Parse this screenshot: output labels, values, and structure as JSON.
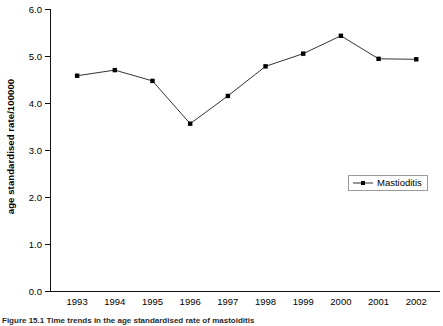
{
  "chart_data": {
    "type": "line",
    "title": "",
    "xlabel": "",
    "ylabel": "age standardised rate/100000",
    "categories": [
      "1993",
      "1994",
      "1995",
      "1996",
      "1997",
      "1998",
      "1999",
      "2000",
      "2001",
      "2002"
    ],
    "series": [
      {
        "name": "Mastioditis",
        "values": [
          4.58,
          4.7,
          4.47,
          3.56,
          4.15,
          4.78,
          5.05,
          5.43,
          4.94,
          4.93
        ]
      }
    ],
    "ylim": [
      0.0,
      6.0
    ],
    "ytick_labels": [
      "0.0",
      "1.0",
      "2.0",
      "3.0",
      "4.0",
      "5.0",
      "6.0"
    ],
    "ytick_values": [
      0.0,
      1.0,
      2.0,
      3.0,
      4.0,
      5.0,
      6.0
    ],
    "grid": false,
    "legend_position": "center-right",
    "line_color": "#333333",
    "marker_color": "#000000",
    "axis_color": "#111111"
  },
  "legend": {
    "entries": [
      {
        "label": "Mastioditis",
        "symbol": "line-marker-symbol"
      }
    ]
  },
  "caption": {
    "text": "Figure 15.1    Time trends in the age standardised rate of mastoiditis"
  }
}
